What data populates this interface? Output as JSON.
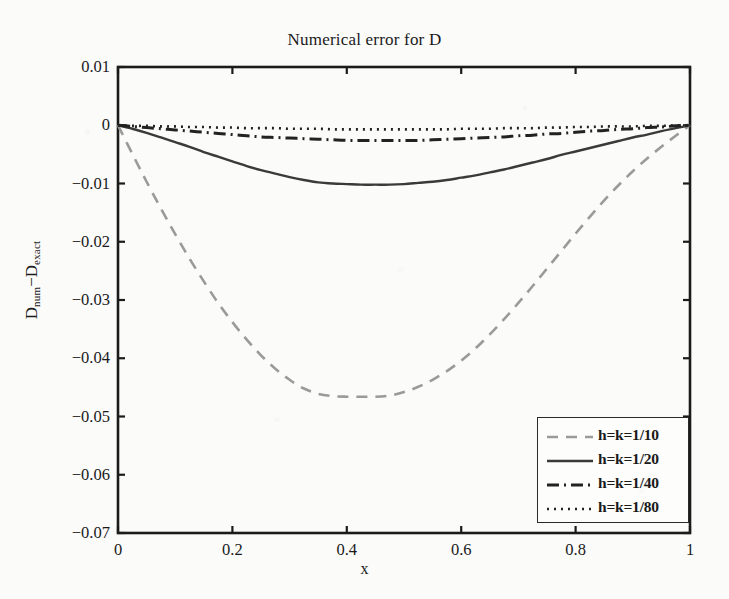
{
  "chart_data": {
    "type": "line",
    "title": "Numerical error for D",
    "xlabel": "x",
    "ylabel": "D_num - D_exact",
    "ylabel_base": "D",
    "ylabel_sub1": "num",
    "ylabel_minus": "−D",
    "ylabel_sub2": "exact",
    "xlim": [
      0,
      1
    ],
    "ylim": [
      -0.07,
      0.01
    ],
    "grid": false,
    "legend_position": "lower right",
    "xticks": [
      "0",
      "0.2",
      "0.4",
      "0.6",
      "0.8",
      "1"
    ],
    "xtick_values": [
      0,
      0.2,
      0.4,
      0.6,
      0.8,
      1
    ],
    "yticks": [
      "0.01",
      "0",
      "−0.01",
      "−0.02",
      "−0.03",
      "−0.04",
      "−0.05",
      "−0.06",
      "−0.07"
    ],
    "ytick_values": [
      0.01,
      0,
      -0.01,
      -0.02,
      -0.03,
      -0.04,
      -0.05,
      -0.06,
      -0.07
    ],
    "x": [
      0,
      0.025,
      0.05,
      0.075,
      0.1,
      0.125,
      0.15,
      0.175,
      0.2,
      0.225,
      0.25,
      0.275,
      0.3,
      0.325,
      0.35,
      0.375,
      0.4,
      0.425,
      0.45,
      0.475,
      0.5,
      0.525,
      0.55,
      0.575,
      0.6,
      0.625,
      0.65,
      0.675,
      0.7,
      0.725,
      0.75,
      0.775,
      0.8,
      0.825,
      0.85,
      0.875,
      0.9,
      0.925,
      0.95,
      0.975,
      1
    ],
    "series": [
      {
        "name": "h=k=1/10",
        "style": "dashed",
        "color": "#9a9a9a",
        "min_value": -0.0466,
        "min_at_x": 0.45,
        "values": [
          0,
          -0.0049,
          -0.0097,
          -0.0143,
          -0.0187,
          -0.0229,
          -0.0268,
          -0.0305,
          -0.0338,
          -0.0368,
          -0.0395,
          -0.0418,
          -0.0437,
          -0.0452,
          -0.0461,
          -0.0465,
          -0.0466,
          -0.0466,
          -0.0466,
          -0.0464,
          -0.0458,
          -0.0449,
          -0.0437,
          -0.0422,
          -0.0404,
          -0.0383,
          -0.0359,
          -0.0333,
          -0.0305,
          -0.0276,
          -0.0246,
          -0.0216,
          -0.0186,
          -0.0157,
          -0.0129,
          -0.0103,
          -0.0079,
          -0.0057,
          -0.0037,
          -0.0018,
          0
        ]
      },
      {
        "name": "h=k=1/20",
        "style": "solid",
        "color": "#3a3a3a",
        "min_value": -0.0102,
        "min_at_x": 0.46,
        "values": [
          0,
          -0.0006,
          -0.0013,
          -0.0021,
          -0.0029,
          -0.0037,
          -0.0046,
          -0.0054,
          -0.0062,
          -0.007,
          -0.0077,
          -0.0083,
          -0.0089,
          -0.0094,
          -0.0098,
          -0.01,
          -0.0101,
          -0.0102,
          -0.0102,
          -0.0102,
          -0.0101,
          -0.0099,
          -0.0097,
          -0.0094,
          -0.009,
          -0.0086,
          -0.0081,
          -0.0076,
          -0.007,
          -0.0064,
          -0.0058,
          -0.0051,
          -0.0045,
          -0.0039,
          -0.0033,
          -0.0027,
          -0.0021,
          -0.0016,
          -0.001,
          -0.0005,
          0
        ]
      },
      {
        "name": "h=k=1/40",
        "style": "dashdot",
        "color": "#222222",
        "min_value": -0.0026,
        "min_at_x": 0.48,
        "values": [
          0,
          -0.0002,
          -0.0004,
          -0.0006,
          -0.0008,
          -0.001,
          -0.0012,
          -0.0014,
          -0.0016,
          -0.0018,
          -0.002,
          -0.0021,
          -0.0022,
          -0.0023,
          -0.0024,
          -0.0025,
          -0.0026,
          -0.0026,
          -0.0026,
          -0.0026,
          -0.0026,
          -0.0026,
          -0.0025,
          -0.0024,
          -0.0023,
          -0.0022,
          -0.0021,
          -0.002,
          -0.0018,
          -0.0017,
          -0.0015,
          -0.0014,
          -0.0012,
          -0.001,
          -0.0009,
          -0.0007,
          -0.0006,
          -0.0004,
          -0.0003,
          -0.0001,
          0
        ]
      },
      {
        "name": "h=k=1/80",
        "style": "dotted",
        "color": "#222222",
        "min_value": -0.0007,
        "min_at_x": 0.5,
        "values": [
          0,
          -0.0001,
          -0.0001,
          -0.0002,
          -0.0002,
          -0.0003,
          -0.0003,
          -0.0004,
          -0.0004,
          -0.0005,
          -0.0005,
          -0.0005,
          -0.0006,
          -0.0006,
          -0.0006,
          -0.0007,
          -0.0007,
          -0.0007,
          -0.0007,
          -0.0007,
          -0.0007,
          -0.0007,
          -0.0007,
          -0.0007,
          -0.0006,
          -0.0006,
          -0.0006,
          -0.0005,
          -0.0005,
          -0.0005,
          -0.0004,
          -0.0004,
          -0.0003,
          -0.0003,
          -0.0002,
          -0.0002,
          -0.0002,
          -0.0001,
          -0.0001,
          0,
          0
        ]
      }
    ]
  },
  "legend": {
    "entries": [
      {
        "label": "h=k=1/10"
      },
      {
        "label": "h=k=1/20"
      },
      {
        "label": "h=k=1/40"
      },
      {
        "label": "h=k=1/80"
      }
    ]
  }
}
